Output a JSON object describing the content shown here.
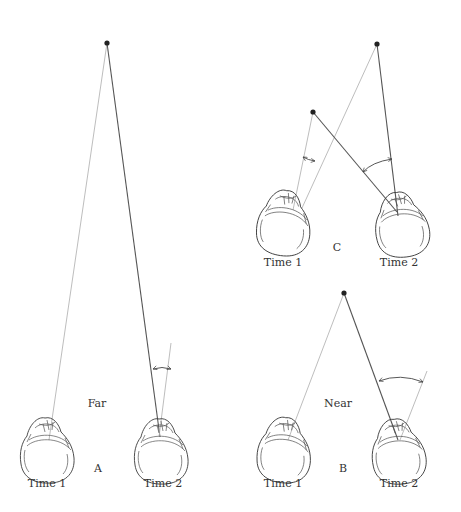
{
  "figure": {
    "panels": [
      {
        "id": "A",
        "letter": "A",
        "distance_label": "Far",
        "time1_label": "Time 1",
        "time2_label": "Time 2",
        "target": {
          "x": 107,
          "y": 43
        }
      },
      {
        "id": "B",
        "letter": "B",
        "distance_label": "Near",
        "time1_label": "Time 1",
        "time2_label": "Time 2",
        "target": {
          "x": 344,
          "y": 293
        }
      },
      {
        "id": "C",
        "letter": "C",
        "time1_label": "Time 1",
        "time2_label": "Time 2",
        "targets": [
          {
            "x": 313,
            "y": 112
          },
          {
            "x": 377,
            "y": 44
          }
        ]
      }
    ],
    "colors": {
      "line_gaze_time1": "#b5b5b5",
      "line_gaze_time2": "#555555",
      "target_dot": "#222222"
    }
  }
}
